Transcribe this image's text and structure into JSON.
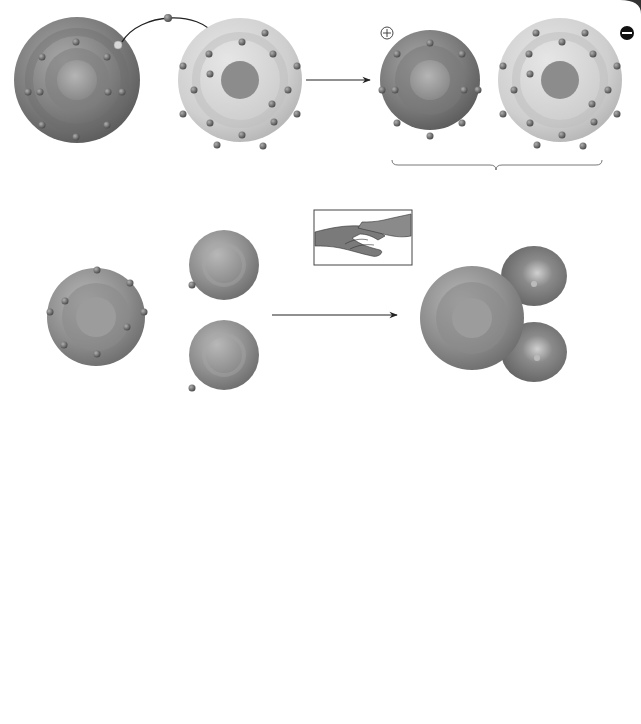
{
  "figure": {
    "panels": {
      "A": {
        "letter": "A",
        "sodium_atom": {
          "label": "Sodium atom (Na)",
          "protons": "11 p",
          "neutrons": "12 n",
          "proton_sup": "+",
          "neutron_sup": "0"
        },
        "chlorine_atom": {
          "label": "Chlorine atom (Cl)",
          "protons": "17 p",
          "neutrons": "18 n",
          "proton_sup": "+",
          "neutron_sup": "0"
        },
        "sodium_ion": {
          "label": "Sodium ion (Na)",
          "protons": "11 p",
          "neutrons": "12 n",
          "proton_sup": "+",
          "neutron_sup": "0",
          "charge": "+"
        },
        "chloride_ion": {
          "label": "Chloride ion (Cl)",
          "protons": "17 p",
          "neutrons": "18 n",
          "proton_sup": "+",
          "neutron_sup": "0",
          "charge": "−"
        },
        "compound_label": "Sodium chloride (NaCl)"
      },
      "B": {
        "letter": "B",
        "oxygen_atom": {
          "label": "Oxygen atom (O)",
          "protons": "8 p",
          "neutrons": "8 n",
          "proton_sup": "+",
          "neutron_sup": "0"
        },
        "hydrogen_atom": {
          "label": "Hydrogen atom (H)",
          "protons": "1 p",
          "proton_sup": "+"
        },
        "water_molecule": {
          "label_prefix": "Water molecule (H",
          "label_sub": "2",
          "label_suffix": "O)"
        },
        "handshake_icon": "handshake-icon"
      },
      "C": {
        "letter": "C",
        "label": "Attraction between water molecules",
        "charges": [
          "+",
          "−",
          "+",
          "−"
        ]
      }
    },
    "colors": {
      "sodium": "#7a7a7a",
      "chlorine": "#c8c8c8",
      "electron": "#6b6b6b",
      "background": "#ffffff",
      "text": "#2a2a2a"
    }
  }
}
